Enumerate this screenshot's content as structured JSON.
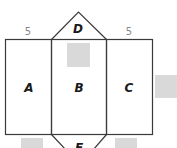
{
  "diagram": {
    "type": "net of triangular prism",
    "faces": {
      "A": "A",
      "B": "B",
      "C": "C",
      "D": "D",
      "E": "E"
    },
    "dimensions": {
      "top_left_edge": "5",
      "top_right_edge": "5"
    },
    "hidden_answer_boxes": 4,
    "colors": {
      "stroke": "#3a3a3a",
      "answer_box": "#d9d9d9",
      "dimension_text": "#888888"
    }
  }
}
